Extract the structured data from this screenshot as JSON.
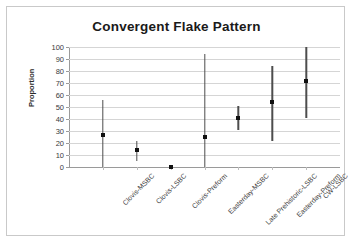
{
  "chart_data": {
    "type": "scatter",
    "title": "Convergent Flake Pattern",
    "xlabel": "",
    "ylabel": "Proportion",
    "ylim": [
      0,
      100
    ],
    "ytick_step": 10,
    "yticks": [
      0,
      10,
      20,
      30,
      40,
      50,
      60,
      70,
      80,
      90,
      100
    ],
    "ytick_labels": [
      "0",
      "10",
      "20",
      "30",
      "40",
      "50",
      "60",
      "70",
      "80",
      "90",
      "100"
    ],
    "grid": true,
    "legend": "none",
    "categories": [
      "Clovis-MSBC",
      "Clovis-LSBC",
      "Clovis-Preform",
      "Easterday-MSBC",
      "Late Prehistoric-LSBC",
      "Easterday-Preform",
      "CW-LSBC"
    ],
    "series": [
      {
        "name": "Proportion",
        "values": [
          27,
          14,
          0,
          25,
          41,
          54,
          72
        ],
        "error_low": [
          0,
          5,
          0,
          0,
          31,
          22,
          41
        ],
        "error_high": [
          56,
          22,
          0,
          94,
          51,
          84,
          100
        ]
      }
    ]
  }
}
